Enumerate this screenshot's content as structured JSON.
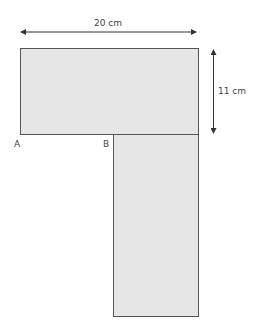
{
  "diagram": {
    "type": "L-shape composite rectangle",
    "dimensions": {
      "width_label": "20 cm",
      "height_label": "11 cm"
    },
    "points": {
      "a": "A",
      "b": "B"
    },
    "colors": {
      "fill": "#e6e6e6",
      "stroke": "#555555",
      "arrow": "#333333"
    }
  }
}
